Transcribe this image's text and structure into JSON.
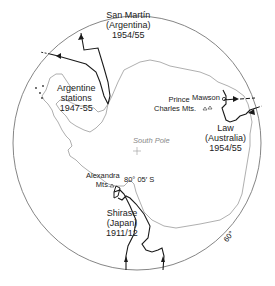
{
  "map": {
    "type": "polar projection map of Antarctica",
    "latitude_circle_label": "60°",
    "center_label": "South Pole",
    "colors": {
      "coast": "#9a9a9a",
      "route": "#1a1a1a",
      "circle": "#777777",
      "text": "#222222"
    }
  },
  "expeditions": [
    {
      "name": "San Martín",
      "country": "(Argentina)",
      "years": "1954/55"
    },
    {
      "name": "Argentine",
      "name2": "stations",
      "years": "1947-55"
    },
    {
      "name": "Law",
      "country": "(Australia)",
      "years": "1954/55"
    },
    {
      "name": "Shirase",
      "country": "(Japan)",
      "years": "1911/12"
    }
  ],
  "places": {
    "mawson": "Mawson",
    "prince_charles_1": "Prince",
    "prince_charles_2": "Charles Mts.",
    "alexandra_1": "Alexandra",
    "alexandra_2": "Mts.",
    "latitude_note": "80° 05′ S"
  }
}
